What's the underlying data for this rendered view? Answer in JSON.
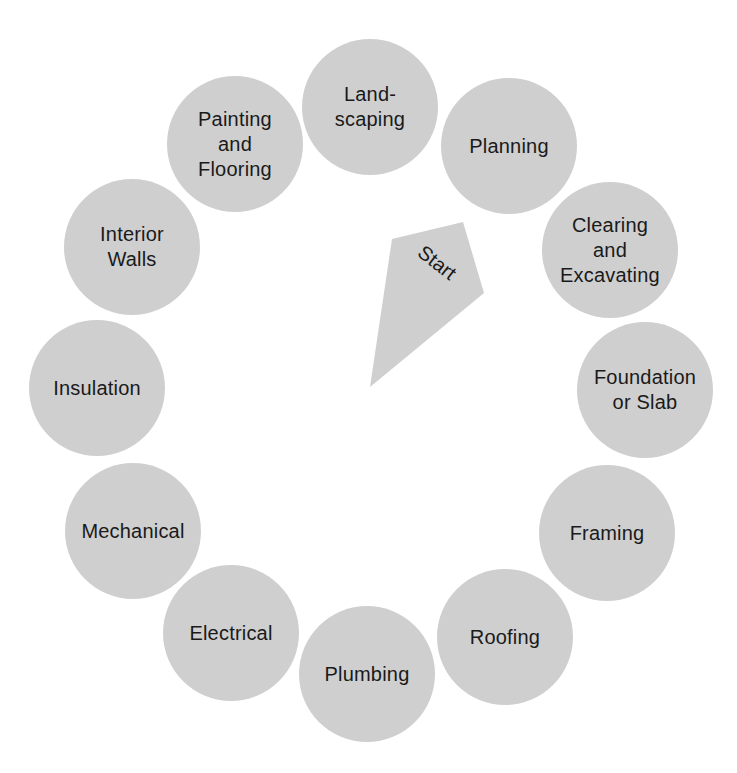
{
  "diagram": {
    "type": "cycle",
    "fill_color": "#cfcfcf",
    "text_color": "#1a1a1a",
    "start": {
      "label": "Start",
      "points": "392,239 463,222 484,293 370,387"
    },
    "stages": [
      {
        "id": "planning",
        "label": "Planning",
        "cx": 509,
        "cy": 146
      },
      {
        "id": "clearing",
        "label": "Clearing\nand\nExcavating",
        "cx": 610,
        "cy": 250
      },
      {
        "id": "foundation",
        "label": "Foundation\nor Slab",
        "cx": 645,
        "cy": 390
      },
      {
        "id": "framing",
        "label": "Framing",
        "cx": 607,
        "cy": 533
      },
      {
        "id": "roofing",
        "label": "Roofing",
        "cx": 505,
        "cy": 637
      },
      {
        "id": "plumbing",
        "label": "Plumbing",
        "cx": 367,
        "cy": 674
      },
      {
        "id": "electrical",
        "label": "Electrical",
        "cx": 231,
        "cy": 633
      },
      {
        "id": "mechanical",
        "label": "Mechanical",
        "cx": 133,
        "cy": 531
      },
      {
        "id": "insulation",
        "label": "Insulation",
        "cx": 97,
        "cy": 388
      },
      {
        "id": "interior-walls",
        "label": "Interior\nWalls",
        "cx": 132,
        "cy": 247
      },
      {
        "id": "painting",
        "label": "Painting\nand\nFlooring",
        "cx": 235,
        "cy": 144
      },
      {
        "id": "landscaping",
        "label": "Land-\nscaping",
        "cx": 370,
        "cy": 107
      }
    ]
  }
}
